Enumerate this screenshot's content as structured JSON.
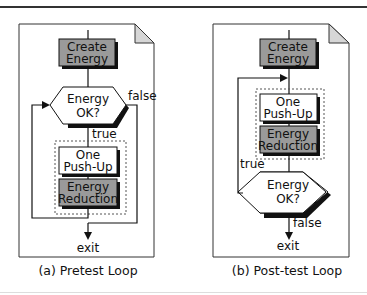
{
  "colors": {
    "line": "#111111",
    "shaded_box": "#9a9a9a",
    "white_box": "#ffffff",
    "page_fold": "#d6d6d6"
  },
  "panels": [
    {
      "id": "pretest",
      "caption": "(a) Pretest Loop",
      "create_line1": "Create",
      "create_line2": "Energy",
      "decision_line1": "Energy",
      "decision_line2": "OK?",
      "true_label": "true",
      "false_label": "false",
      "pushup_line1": "One",
      "pushup_line2": "Push-Up",
      "reduction_line1": "Energy",
      "reduction_line2": "Reduction",
      "exit_label": "exit"
    },
    {
      "id": "posttest",
      "caption": "(b) Post-test Loop",
      "create_line1": "Create",
      "create_line2": "Energy",
      "decision_line1": "Energy",
      "decision_line2": "OK?",
      "true_label": "true",
      "false_label": "false",
      "pushup_line1": "One",
      "pushup_line2": "Push-Up",
      "reduction_line1": "Energy",
      "reduction_line2": "Reduction",
      "exit_label": "exit"
    }
  ]
}
